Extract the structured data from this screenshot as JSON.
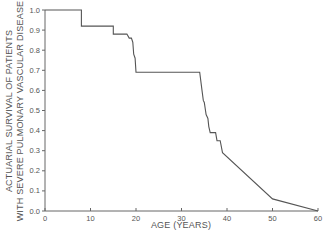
{
  "chart_data": {
    "type": "line",
    "title": "",
    "xlabel": "AGE (YEARS)",
    "ylabel_lines": [
      "ACTUARIAL SURVIVAL OF PATIENTS",
      "WITH SEVERE PULMONARY VASCULAR DISEASE"
    ],
    "xlim": [
      0,
      60
    ],
    "ylim": [
      0.0,
      1.0
    ],
    "x_ticks": [
      0,
      10,
      20,
      30,
      40,
      50,
      60
    ],
    "x_tick_labels": [
      "0",
      "10",
      "20",
      "30",
      "40",
      "50",
      "60"
    ],
    "y_ticks": [
      0.0,
      0.1,
      0.2,
      0.3,
      0.4,
      0.5,
      0.6,
      0.7,
      0.8,
      0.9,
      1.0
    ],
    "y_tick_labels": [
      "0.0",
      "0.1",
      "0.2",
      "0.3",
      "0.4",
      "0.5",
      "0.6",
      "0.7",
      "0.8",
      "0.9",
      "1.0"
    ],
    "grid": false,
    "legend": null,
    "series": [
      {
        "name": "Actuarial survival",
        "points": [
          [
            0,
            1.0
          ],
          [
            8,
            1.0
          ],
          [
            8,
            0.92
          ],
          [
            15,
            0.92
          ],
          [
            15,
            0.88
          ],
          [
            18,
            0.88
          ],
          [
            18.5,
            0.86
          ],
          [
            19,
            0.86
          ],
          [
            19.3,
            0.84
          ],
          [
            19.5,
            0.78
          ],
          [
            19.8,
            0.76
          ],
          [
            20,
            0.69
          ],
          [
            34,
            0.69
          ],
          [
            34.5,
            0.6
          ],
          [
            34.8,
            0.55
          ],
          [
            35,
            0.54
          ],
          [
            35.4,
            0.48
          ],
          [
            35.8,
            0.46
          ],
          [
            36,
            0.42
          ],
          [
            36.3,
            0.39
          ],
          [
            37.5,
            0.39
          ],
          [
            37.8,
            0.35
          ],
          [
            38.5,
            0.35
          ],
          [
            39,
            0.29
          ],
          [
            50,
            0.06
          ],
          [
            60,
            0.0
          ]
        ]
      }
    ]
  },
  "colors": {
    "line": "#555555",
    "axis": "#666666",
    "text": "#555555",
    "background": "#ffffff"
  }
}
